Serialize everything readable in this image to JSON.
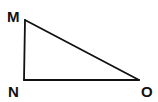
{
  "diagram": {
    "type": "right-triangle",
    "stroke_color": "#111111",
    "background": "#ffffff",
    "vertices": [
      {
        "label": "M",
        "x": 25,
        "y": 20,
        "label_x": 7,
        "label_y": 22
      },
      {
        "label": "N",
        "x": 24,
        "y": 80,
        "label_x": 8,
        "label_y": 97
      },
      {
        "label": "O",
        "x": 139,
        "y": 80,
        "label_x": 141,
        "label_y": 97
      }
    ],
    "edges": [
      {
        "from": "M",
        "to": "N"
      },
      {
        "from": "N",
        "to": "O"
      },
      {
        "from": "M",
        "to": "O"
      }
    ],
    "right_angle_at": "N"
  }
}
